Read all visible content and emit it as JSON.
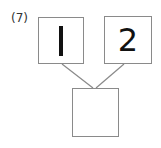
{
  "problem": {
    "number_label": "(7)",
    "top_left_value": "1",
    "top_right_value": "2",
    "bottom_value": ""
  },
  "colors": {
    "box_border": "#8a8a8a",
    "text": "#111111"
  }
}
